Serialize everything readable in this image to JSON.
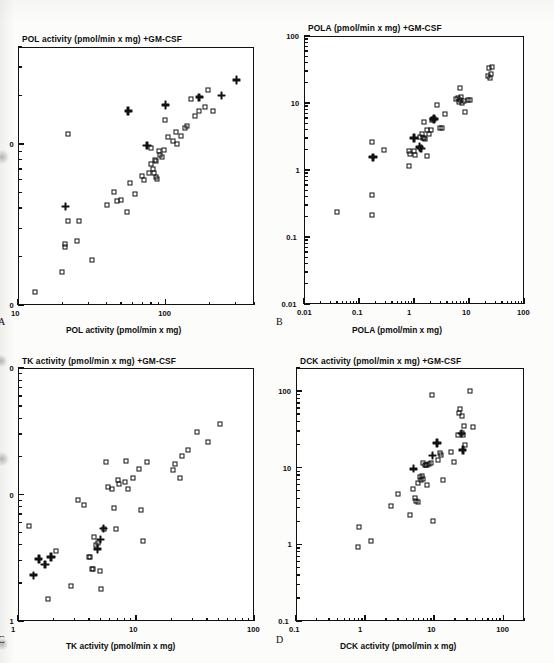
{
  "figure": {
    "marker_legend": [
      "open-square",
      "bold-cross"
    ],
    "ink_color": "#111111",
    "paper_color": "#fcfcfb"
  },
  "chart_data": [
    {
      "type": "scatter",
      "panel": "A",
      "title": "POL activity (pmol/min x mg) +GM-CSF",
      "xlabel": "POL activity (pmol/min x mg)",
      "ylabel": "POL activity (pmol/min x mg) +GM-CSF",
      "xscale": "log",
      "yscale": "log",
      "xlim": [
        10,
        400
      ],
      "ylim": [
        10,
        400
      ],
      "xticks": [
        10,
        100
      ],
      "xtick_labels": [
        "10",
        "100"
      ],
      "yticks": [
        10,
        100
      ],
      "ytick_labels": [
        "10",
        "100"
      ],
      "ytick_labels_clipped": [
        "0",
        "0"
      ],
      "grid": false,
      "legend": "none",
      "series": [
        {
          "name": "open-square",
          "marker": "open-square",
          "points": [
            [
              13,
              12
            ],
            [
              20,
              16
            ],
            [
              21,
              23
            ],
            [
              21,
              24
            ],
            [
              25,
              25
            ],
            [
              22,
              33
            ],
            [
              26,
              33
            ],
            [
              32,
              19
            ],
            [
              40,
              42
            ],
            [
              45,
              50
            ],
            [
              47,
              44
            ],
            [
              50,
              45
            ],
            [
              55,
              38
            ],
            [
              58,
              57
            ],
            [
              62,
              49
            ],
            [
              22,
              115
            ],
            [
              70,
              63
            ],
            [
              72,
              60
            ],
            [
              78,
              66
            ],
            [
              80,
              95
            ],
            [
              80,
              75
            ],
            [
              82,
              70
            ],
            [
              84,
              66
            ],
            [
              85,
              80
            ],
            [
              86,
              78
            ],
            [
              86,
              62
            ],
            [
              88,
              61
            ],
            [
              90,
              90
            ],
            [
              92,
              86
            ],
            [
              95,
              83
            ],
            [
              98,
              92
            ],
            [
              100,
              140
            ],
            [
              105,
              110
            ],
            [
              112,
              105
            ],
            [
              118,
              118
            ],
            [
              120,
              100
            ],
            [
              128,
              112
            ],
            [
              135,
              125
            ],
            [
              140,
              130
            ],
            [
              150,
              190
            ],
            [
              160,
              150
            ],
            [
              168,
              160
            ],
            [
              185,
              170
            ],
            [
              195,
              215
            ],
            [
              210,
              160
            ]
          ]
        },
        {
          "name": "bold-cross",
          "marker": "bold-cross",
          "points": [
            [
              21,
              41
            ],
            [
              56,
              160
            ],
            [
              75,
              98
            ],
            [
              100,
              175
            ],
            [
              170,
              195
            ],
            [
              240,
              200
            ],
            [
              305,
              250
            ]
          ]
        }
      ]
    },
    {
      "type": "scatter",
      "panel": "B",
      "title": "POLA (pmol/min x mg) +GM-CSF",
      "xlabel": "POLA (pmol/min x mg)",
      "ylabel": "POLA (pmol/min x mg) +GM-CSF",
      "xscale": "log",
      "yscale": "log",
      "xlim": [
        0.01,
        100
      ],
      "ylim": [
        0.01,
        100
      ],
      "xticks": [
        0.01,
        0.1,
        1,
        10,
        100
      ],
      "xtick_labels": [
        "0.01",
        "0.1",
        "1",
        "10",
        "100"
      ],
      "yticks": [
        0.01,
        0.1,
        1,
        10,
        100
      ],
      "ytick_labels": [
        "0.01",
        "0.1",
        "1",
        "10",
        "100"
      ],
      "grid": false,
      "legend": "none",
      "series": [
        {
          "name": "open-square",
          "marker": "open-square",
          "points": [
            [
              0.04,
              0.24
            ],
            [
              0.17,
              0.21
            ],
            [
              0.17,
              0.43
            ],
            [
              0.17,
              2.6
            ],
            [
              0.28,
              2.0
            ],
            [
              0.8,
              1.15
            ],
            [
              0.82,
              1.9
            ],
            [
              0.85,
              1.75
            ],
            [
              1.0,
              1.95
            ],
            [
              1.05,
              1.7
            ],
            [
              1.3,
              3.1
            ],
            [
              1.4,
              3.4
            ],
            [
              1.45,
              3.0
            ],
            [
              1.5,
              3.0
            ],
            [
              1.6,
              2.95
            ],
            [
              1.7,
              4.0
            ],
            [
              1.7,
              1.6
            ],
            [
              1.5,
              5.2
            ],
            [
              1.9,
              3.5
            ],
            [
              2.0,
              3.9
            ],
            [
              2.1,
              5.6
            ],
            [
              2.2,
              5.8
            ],
            [
              2.3,
              5.7
            ],
            [
              2.6,
              9.4
            ],
            [
              3.0,
              4.2
            ],
            [
              3.2,
              4.3
            ],
            [
              3.6,
              6.8
            ],
            [
              5.8,
              11.5
            ],
            [
              6.2,
              12.0
            ],
            [
              6.5,
              10.5
            ],
            [
              6.8,
              17.0
            ],
            [
              7.0,
              11.0
            ],
            [
              7.2,
              12.5
            ],
            [
              7.5,
              10.0
            ],
            [
              8.0,
              10.8
            ],
            [
              8.6,
              7.4
            ],
            [
              9.5,
              11.0
            ],
            [
              10.5,
              11.0
            ],
            [
              22,
              25
            ],
            [
              23,
              33
            ],
            [
              24,
              24
            ],
            [
              25,
              27
            ],
            [
              26,
              35
            ]
          ]
        },
        {
          "name": "bold-cross",
          "marker": "bold-cross",
          "points": [
            [
              0.18,
              1.55
            ],
            [
              1.0,
              3.0
            ],
            [
              1.25,
              2.2
            ],
            [
              1.35,
              2.1
            ],
            [
              2.3,
              5.8
            ]
          ]
        }
      ]
    },
    {
      "type": "scatter",
      "panel": "C",
      "title": "TK activity (pmol/min x mg) +GM-CSF",
      "xlabel": "TK activity (pmol/min x mg)",
      "ylabel": "TK activity (pmol/min x mg) +GM-CSF",
      "xscale": "log",
      "yscale": "log",
      "xlim": [
        1,
        100
      ],
      "ylim": [
        1,
        100
      ],
      "xticks": [
        1,
        10,
        100
      ],
      "xtick_labels": [
        "1",
        "10",
        "100"
      ],
      "yticks": [
        1,
        10,
        100
      ],
      "ytick_labels": [
        "1",
        "10",
        "100"
      ],
      "ytick_labels_clipped": [
        "1",
        "0",
        "0"
      ],
      "grid": false,
      "legend": "none",
      "series": [
        {
          "name": "open-square",
          "marker": "open-square",
          "points": [
            [
              1.25,
              5.6
            ],
            [
              1.8,
              1.5
            ],
            [
              2.1,
              3.6
            ],
            [
              2.8,
              1.9
            ],
            [
              3.2,
              9.0
            ],
            [
              3.6,
              8.2
            ],
            [
              4.0,
              3.2
            ],
            [
              4.1,
              3.2
            ],
            [
              4.2,
              2.6
            ],
            [
              4.3,
              2.6
            ],
            [
              4.4,
              4.6
            ],
            [
              4.6,
              4.0
            ],
            [
              4.8,
              4.1
            ],
            [
              5.0,
              2.5
            ],
            [
              5.1,
              1.8
            ],
            [
              5.4,
              5.3
            ],
            [
              5.6,
              18.0
            ],
            [
              5.8,
              11.5
            ],
            [
              6.2,
              11.0
            ],
            [
              6.5,
              7.8
            ],
            [
              6.8,
              5.3
            ],
            [
              7.0,
              13.0
            ],
            [
              7.2,
              12.0
            ],
            [
              8.0,
              12.5
            ],
            [
              8.2,
              18.5
            ],
            [
              8.6,
              11.0
            ],
            [
              9.5,
              13.5
            ],
            [
              10.5,
              16.0
            ],
            [
              11.0,
              7.5
            ],
            [
              11.5,
              4.3
            ],
            [
              12.5,
              18.0
            ],
            [
              20.5,
              15.5
            ],
            [
              21.5,
              17.5
            ],
            [
              23.5,
              13.5
            ],
            [
              24.5,
              20.0
            ],
            [
              27.5,
              22.5
            ],
            [
              33,
              31
            ],
            [
              41,
              26
            ],
            [
              52,
              36
            ]
          ]
        },
        {
          "name": "bold-cross",
          "marker": "bold-cross",
          "points": [
            [
              1.35,
              2.3
            ],
            [
              1.5,
              3.1
            ],
            [
              1.7,
              2.8
            ],
            [
              1.9,
              3.2
            ],
            [
              4.7,
              3.7
            ],
            [
              5.0,
              4.4
            ],
            [
              5.3,
              5.4
            ]
          ]
        }
      ]
    },
    {
      "type": "scatter",
      "panel": "D",
      "title": "DCK activity (pmol/min x mg) +GM-CSF",
      "xlabel": "DCK activity (pmol/min x mg)",
      "ylabel": "DCK activity (pmol/min x mg) +GM-CSF",
      "xscale": "log",
      "yscale": "log",
      "xlim": [
        0.1,
        200
      ],
      "ylim": [
        0.1,
        200
      ],
      "xticks": [
        0.1,
        1,
        10,
        100
      ],
      "xtick_labels": [
        "0.1",
        "1",
        "10",
        "100"
      ],
      "yticks": [
        0.1,
        1,
        10,
        100
      ],
      "ytick_labels": [
        "0.1",
        "1",
        "10",
        "100"
      ],
      "grid": false,
      "legend": "none",
      "series": [
        {
          "name": "open-square",
          "marker": "open-square",
          "points": [
            [
              0.8,
              0.92
            ],
            [
              0.82,
              1.7
            ],
            [
              1.2,
              1.12
            ],
            [
              2.4,
              3.2
            ],
            [
              3.0,
              4.5
            ],
            [
              4.5,
              2.4
            ],
            [
              5.0,
              5.2
            ],
            [
              5.2,
              4.0
            ],
            [
              5.5,
              3.7
            ],
            [
              5.8,
              3.6
            ],
            [
              5.9,
              6.3
            ],
            [
              6.2,
              7.5
            ],
            [
              6.4,
              7.0
            ],
            [
              6.6,
              7.8
            ],
            [
              6.8,
              7.2
            ],
            [
              7.0,
              11.5
            ],
            [
              7.3,
              11.0
            ],
            [
              7.5,
              11.0
            ],
            [
              7.8,
              5.9
            ],
            [
              8.0,
              11.0
            ],
            [
              8.5,
              11.2
            ],
            [
              9.0,
              11.5
            ],
            [
              9.2,
              88
            ],
            [
              9.6,
              2.0
            ],
            [
              11.5,
              12.5
            ],
            [
              12.0,
              15.5
            ],
            [
              12.5,
              14.5
            ],
            [
              13.5,
              6.9
            ],
            [
              17.5,
              16.0
            ],
            [
              19.5,
              12.0
            ],
            [
              22,
              27
            ],
            [
              23,
              52
            ],
            [
              24,
              58
            ],
            [
              25,
              48
            ],
            [
              25.5,
              28
            ],
            [
              26,
              27
            ],
            [
              27,
              35
            ],
            [
              28,
              20
            ],
            [
              33,
              100
            ],
            [
              36,
              34
            ]
          ]
        },
        {
          "name": "bold-cross",
          "marker": "bold-cross",
          "points": [
            [
              5.0,
              9.7
            ],
            [
              9.5,
              14.5
            ],
            [
              11.0,
              21.0
            ],
            [
              25,
              28
            ],
            [
              26,
              17
            ]
          ]
        }
      ]
    }
  ]
}
